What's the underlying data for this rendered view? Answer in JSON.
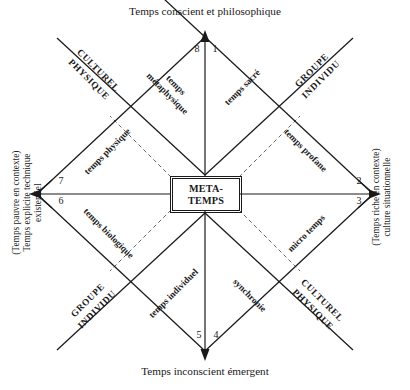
{
  "diagram": {
    "title_top": "Temps conscient et philosophique",
    "title_bottom": "Temps inconscient émergent",
    "center": {
      "line1": "META-",
      "line2": "TEMPS"
    },
    "side_left": {
      "line1": "(Temps pauvre  en contexte)",
      "line2": "Temps explicite technique",
      "line3": "existentiel"
    },
    "side_right": {
      "line1": "(Temps riche  en contexte)",
      "line2": "culture situationnelle"
    },
    "quadrants": [
      {
        "name": "top-left",
        "line1": "CULTUREL",
        "line2": "PHYSIQUE"
      },
      {
        "name": "top-right",
        "line1": "GROUPE",
        "line2": "INDIVIDU"
      },
      {
        "name": "bottom-left",
        "line1": "GROUPE",
        "line2": "INDIVIDU"
      },
      {
        "name": "bottom-right",
        "line1": "CULTUREL",
        "line2": "PHYSIQUE"
      }
    ],
    "edges": [
      {
        "name": "temps-metaphysique",
        "line1": "temps",
        "line2": "métaphysique"
      },
      {
        "name": "temps-sacre",
        "line1": "temps sacré",
        "line2": ""
      },
      {
        "name": "temps-profane",
        "line1": "temps profane",
        "line2": ""
      },
      {
        "name": "micro-temps",
        "line1": "micro temps",
        "line2": ""
      },
      {
        "name": "synchronie",
        "line1": "synchronie",
        "line2": ""
      },
      {
        "name": "temps-individuel",
        "line1": "temps individuel",
        "line2": ""
      },
      {
        "name": "temps-biologique",
        "line1": "temps biologique",
        "line2": ""
      },
      {
        "name": "temps-physique",
        "line1": "temps physique",
        "line2": ""
      }
    ],
    "octant_numbers": [
      "1",
      "2",
      "3",
      "4",
      "5",
      "6",
      "7",
      "8"
    ],
    "colors": {
      "line": "#1a1a1a",
      "dashed": "#555555",
      "background": "#ffffff"
    }
  }
}
